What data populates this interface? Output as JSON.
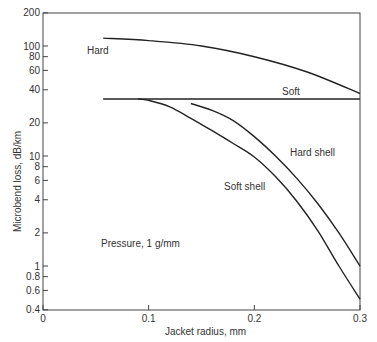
{
  "chart_data": {
    "type": "line",
    "title": "",
    "xlabel": "Jacket radius, mm",
    "ylabel": "Microbend loss, dB/km",
    "xlim": [
      0,
      0.3
    ],
    "ylim": [
      0.4,
      200
    ],
    "yscale": "log",
    "grid": false,
    "x_ticks": [
      "0",
      "0.1",
      "0.2",
      "0.3"
    ],
    "y_ticks": [
      "200",
      "100",
      "80",
      "60",
      "40",
      "20",
      "10",
      "8",
      "6",
      "4",
      "2",
      "1",
      "0.8",
      "0.6",
      "0.4"
    ],
    "annotation": "Pressure, 1 g/mm",
    "series": [
      {
        "name": "Hard",
        "x": [
          0.057,
          0.1,
          0.15,
          0.2,
          0.25,
          0.3
        ],
        "y": [
          118,
          112,
          100,
          80,
          58,
          37
        ]
      },
      {
        "name": "Soft",
        "x": [
          0.057,
          0.3
        ],
        "y": [
          33,
          33
        ]
      },
      {
        "name": "Hard shell",
        "x": [
          0.14,
          0.16,
          0.18,
          0.2,
          0.22,
          0.24,
          0.26,
          0.28,
          0.3
        ],
        "y": [
          30,
          26,
          21,
          15,
          10,
          6.3,
          3.7,
          2.0,
          1.0
        ]
      },
      {
        "name": "Soft shell",
        "x": [
          0.09,
          0.1,
          0.12,
          0.14,
          0.16,
          0.18,
          0.2,
          0.22,
          0.24,
          0.26,
          0.28,
          0.3
        ],
        "y": [
          33,
          32,
          28,
          22,
          17,
          13,
          9.8,
          6.5,
          3.9,
          2.1,
          1.0,
          0.5
        ]
      }
    ]
  }
}
